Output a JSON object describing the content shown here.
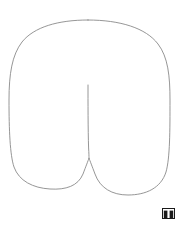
{
  "document": {
    "title": "Line drawing",
    "width": 182,
    "height": 230,
    "background_color": "#ffffff"
  },
  "figure": {
    "name": "rounded-arch-two-leg-outline",
    "stroke_color": "#8a8a8a",
    "fill_color": "none",
    "stroke_width": 0.9,
    "outline_path": "M 88 20 C 120 20 146 28 158 44 C 168 57 170 76 170 100 C 170 130 170 158 166 172 C 161 188 146 195 128 195 C 112 195 100 188 95 174 C 92 166 90 161 89 158 L 89 158 C 88 161 86 166 83 174 C 78 186 66 190 50 189 C 33 188 19 181 14 167 C 10 155 9 130 9 100 C 9 74 12 55 22 42 C 34 27 58 20 88 20 Z",
    "notch_path": "M 88 85 C 88 100 88 130 88.6 148 C 88.9 153 89 156 89 158",
    "anchors": {
      "top_apex": [
        88,
        20
      ],
      "left_widest": [
        9,
        100
      ],
      "right_widest": [
        170,
        100
      ],
      "left_leg_bottom": [
        48,
        189
      ],
      "right_leg_bottom": [
        128,
        195
      ],
      "notch_top": [
        88,
        85
      ],
      "notch_bottom": [
        89,
        158
      ]
    }
  },
  "corner_mark": {
    "name": "signature-glyph",
    "label": "ɯ",
    "description": "Small dark double-bar glyph in the lower right corner resembling a stylized B or m",
    "color": "#1a1a1a"
  }
}
